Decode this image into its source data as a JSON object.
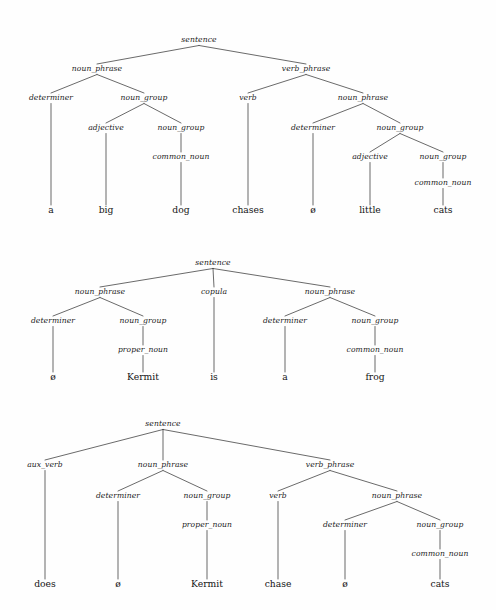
{
  "page": {
    "background_color": "#fefefe",
    "ink_color": "#1a1a1a",
    "width": 496,
    "height": 610
  },
  "glyphs": {
    "empty_element": "ø"
  },
  "trees": [
    {
      "id": "tree-1",
      "sentence_text": "a big dog chases ø little cats",
      "nodes": [
        {
          "id": "t1-n0",
          "label": "sentence",
          "kind": "nonterminal",
          "x": 199,
          "y": 42,
          "parent": null
        },
        {
          "id": "t1-n1",
          "label": "noun_phrase",
          "kind": "nonterminal",
          "x": 97,
          "y": 71,
          "parent": "t1-n0"
        },
        {
          "id": "t1-n2",
          "label": "verb_phrase",
          "kind": "nonterminal",
          "x": 306,
          "y": 71,
          "parent": "t1-n0"
        },
        {
          "id": "t1-n3",
          "label": "determiner",
          "kind": "nonterminal",
          "x": 51,
          "y": 100,
          "parent": "t1-n1"
        },
        {
          "id": "t1-n4",
          "label": "noun_group",
          "kind": "nonterminal",
          "x": 144,
          "y": 100,
          "parent": "t1-n1"
        },
        {
          "id": "t1-n5",
          "label": "verb",
          "kind": "nonterminal",
          "x": 248,
          "y": 100,
          "parent": "t1-n2"
        },
        {
          "id": "t1-n6",
          "label": "noun_phrase",
          "kind": "nonterminal",
          "x": 363,
          "y": 100,
          "parent": "t1-n2"
        },
        {
          "id": "t1-n7",
          "label": "adjective",
          "kind": "nonterminal",
          "x": 106,
          "y": 130,
          "parent": "t1-n4"
        },
        {
          "id": "t1-n8",
          "label": "noun_group",
          "kind": "nonterminal",
          "x": 181,
          "y": 130,
          "parent": "t1-n4"
        },
        {
          "id": "t1-n9",
          "label": "determiner",
          "kind": "nonterminal",
          "x": 313,
          "y": 130,
          "parent": "t1-n6"
        },
        {
          "id": "t1-n10",
          "label": "noun_group",
          "kind": "nonterminal",
          "x": 400,
          "y": 130,
          "parent": "t1-n6"
        },
        {
          "id": "t1-n11",
          "label": "common_noun",
          "kind": "nonterminal",
          "x": 181,
          "y": 159,
          "parent": "t1-n8"
        },
        {
          "id": "t1-n12",
          "label": "adjective",
          "kind": "nonterminal",
          "x": 370,
          "y": 159,
          "parent": "t1-n10"
        },
        {
          "id": "t1-n13",
          "label": "noun_group",
          "kind": "nonterminal",
          "x": 443,
          "y": 159,
          "parent": "t1-n10"
        },
        {
          "id": "t1-n14",
          "label": "common_noun",
          "kind": "nonterminal",
          "x": 443,
          "y": 185,
          "parent": "t1-n13"
        },
        {
          "id": "t1-l0",
          "label": "a",
          "kind": "leaf",
          "x": 51,
          "y": 213,
          "parent": "t1-n3"
        },
        {
          "id": "t1-l1",
          "label": "big",
          "kind": "leaf",
          "x": 106,
          "y": 213,
          "parent": "t1-n7"
        },
        {
          "id": "t1-l2",
          "label": "dog",
          "kind": "leaf",
          "x": 181,
          "y": 213,
          "parent": "t1-n11"
        },
        {
          "id": "t1-l3",
          "label": "chases",
          "kind": "leaf",
          "x": 248,
          "y": 213,
          "parent": "t1-n5"
        },
        {
          "id": "t1-l4",
          "label": "ø",
          "kind": "leaf",
          "x": 313,
          "y": 213,
          "parent": "t1-n9"
        },
        {
          "id": "t1-l5",
          "label": "little",
          "kind": "leaf",
          "x": 370,
          "y": 213,
          "parent": "t1-n12"
        },
        {
          "id": "t1-l6",
          "label": "cats",
          "kind": "leaf",
          "x": 443,
          "y": 213,
          "parent": "t1-n14"
        }
      ]
    },
    {
      "id": "tree-2",
      "sentence_text": "ø Kermit is a frog",
      "nodes": [
        {
          "id": "t2-n0",
          "label": "sentence",
          "kind": "nonterminal",
          "x": 213,
          "y": 265,
          "parent": null
        },
        {
          "id": "t2-n1",
          "label": "noun_phrase",
          "kind": "nonterminal",
          "x": 100,
          "y": 294,
          "parent": "t2-n0"
        },
        {
          "id": "t2-n2",
          "label": "copula",
          "kind": "nonterminal",
          "x": 214,
          "y": 294,
          "parent": "t2-n0"
        },
        {
          "id": "t2-n3",
          "label": "noun_phrase",
          "kind": "nonterminal",
          "x": 330,
          "y": 294,
          "parent": "t2-n0"
        },
        {
          "id": "t2-n4",
          "label": "determiner",
          "kind": "nonterminal",
          "x": 53,
          "y": 323,
          "parent": "t2-n1"
        },
        {
          "id": "t2-n5",
          "label": "noun_group",
          "kind": "nonterminal",
          "x": 143,
          "y": 323,
          "parent": "t2-n1"
        },
        {
          "id": "t2-n6",
          "label": "determiner",
          "kind": "nonterminal",
          "x": 285,
          "y": 323,
          "parent": "t2-n3"
        },
        {
          "id": "t2-n7",
          "label": "noun_group",
          "kind": "nonterminal",
          "x": 375,
          "y": 323,
          "parent": "t2-n3"
        },
        {
          "id": "t2-n8",
          "label": "proper_noun",
          "kind": "nonterminal",
          "x": 143,
          "y": 352,
          "parent": "t2-n5"
        },
        {
          "id": "t2-n9",
          "label": "common_noun",
          "kind": "nonterminal",
          "x": 375,
          "y": 352,
          "parent": "t2-n7"
        },
        {
          "id": "t2-l0",
          "label": "ø",
          "kind": "leaf",
          "x": 53,
          "y": 380,
          "parent": "t2-n4"
        },
        {
          "id": "t2-l1",
          "label": "Kermit",
          "kind": "leaf",
          "x": 143,
          "y": 380,
          "parent": "t2-n8"
        },
        {
          "id": "t2-l2",
          "label": "is",
          "kind": "leaf",
          "x": 214,
          "y": 380,
          "parent": "t2-n2"
        },
        {
          "id": "t2-l3",
          "label": "a",
          "kind": "leaf",
          "x": 285,
          "y": 380,
          "parent": "t2-n6"
        },
        {
          "id": "t2-l4",
          "label": "frog",
          "kind": "leaf",
          "x": 375,
          "y": 380,
          "parent": "t2-n9"
        }
      ]
    },
    {
      "id": "tree-3",
      "sentence_text": "does ø Kermit chase ø cats",
      "nodes": [
        {
          "id": "t3-n0",
          "label": "sentence",
          "kind": "nonterminal",
          "x": 163,
          "y": 426,
          "parent": null
        },
        {
          "id": "t3-n1",
          "label": "aux_verb",
          "kind": "nonterminal",
          "x": 45,
          "y": 467,
          "parent": "t3-n0"
        },
        {
          "id": "t3-n2",
          "label": "noun_phrase",
          "kind": "nonterminal",
          "x": 163,
          "y": 467,
          "parent": "t3-n0"
        },
        {
          "id": "t3-n3",
          "label": "verb_phrase",
          "kind": "nonterminal",
          "x": 330,
          "y": 467,
          "parent": "t3-n0"
        },
        {
          "id": "t3-n4",
          "label": "determiner",
          "kind": "nonterminal",
          "x": 118,
          "y": 498,
          "parent": "t3-n2"
        },
        {
          "id": "t3-n5",
          "label": "noun_group",
          "kind": "nonterminal",
          "x": 207,
          "y": 498,
          "parent": "t3-n2"
        },
        {
          "id": "t3-n6",
          "label": "verb",
          "kind": "nonterminal",
          "x": 278,
          "y": 498,
          "parent": "t3-n3"
        },
        {
          "id": "t3-n7",
          "label": "noun_phrase",
          "kind": "nonterminal",
          "x": 397,
          "y": 498,
          "parent": "t3-n3"
        },
        {
          "id": "t3-n8",
          "label": "proper_noun",
          "kind": "nonterminal",
          "x": 207,
          "y": 527,
          "parent": "t3-n5"
        },
        {
          "id": "t3-n9",
          "label": "determiner",
          "kind": "nonterminal",
          "x": 345,
          "y": 527,
          "parent": "t3-n7"
        },
        {
          "id": "t3-n10",
          "label": "noun_group",
          "kind": "nonterminal",
          "x": 440,
          "y": 527,
          "parent": "t3-n7"
        },
        {
          "id": "t3-n11",
          "label": "common_noun",
          "kind": "nonterminal",
          "x": 440,
          "y": 556,
          "parent": "t3-n10"
        },
        {
          "id": "t3-l0",
          "label": "does",
          "kind": "leaf",
          "x": 45,
          "y": 587,
          "parent": "t3-n1"
        },
        {
          "id": "t3-l1",
          "label": "ø",
          "kind": "leaf",
          "x": 118,
          "y": 587,
          "parent": "t3-n4"
        },
        {
          "id": "t3-l2",
          "label": "Kermit",
          "kind": "leaf",
          "x": 207,
          "y": 587,
          "parent": "t3-n8"
        },
        {
          "id": "t3-l3",
          "label": "chase",
          "kind": "leaf",
          "x": 278,
          "y": 587,
          "parent": "t3-n6"
        },
        {
          "id": "t3-l4",
          "label": "ø",
          "kind": "leaf",
          "x": 345,
          "y": 587,
          "parent": "t3-n9"
        },
        {
          "id": "t3-l5",
          "label": "cats",
          "kind": "leaf",
          "x": 440,
          "y": 587,
          "parent": "t3-n11"
        }
      ]
    }
  ]
}
